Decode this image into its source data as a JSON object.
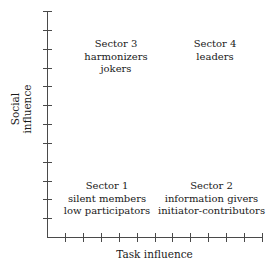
{
  "chart_data": {
    "type": "scatter",
    "title": "",
    "xlabel": "Task influence",
    "ylabel": "Social\ninfluence",
    "grid": false,
    "legend": null,
    "xlim": [
      0,
      12
    ],
    "ylim": [
      0,
      12
    ],
    "x_tick_count": 12,
    "y_tick_count": 12,
    "x_tick_labels": [],
    "y_tick_labels": [],
    "annotations": [
      {
        "id": "sector-1",
        "quadrant": "bottom-left",
        "x": 3,
        "y": 2,
        "lines": [
          "Sector 1",
          "silent members",
          "low participators"
        ]
      },
      {
        "id": "sector-2",
        "quadrant": "bottom-right",
        "x": 9,
        "y": 2,
        "lines": [
          "Sector 2",
          "information givers",
          "initiator-contributors"
        ]
      },
      {
        "id": "sector-3",
        "quadrant": "top-left",
        "x": 3,
        "y": 10,
        "lines": [
          "Sector 3",
          "harmonizers",
          "jokers"
        ]
      },
      {
        "id": "sector-4",
        "quadrant": "top-right",
        "x": 9,
        "y": 10,
        "lines": [
          "Sector 4",
          "leaders"
        ]
      }
    ],
    "colors": {
      "background": "#ffffff",
      "axis": "#4a4a4a",
      "text": "#1a1a1a"
    }
  },
  "axes": {
    "x_title": "Task influence",
    "y_title_line1": "Social",
    "y_title_line2": "influence"
  },
  "sectors": {
    "s3": {
      "line1": "Sector 3",
      "line2": "harmonizers",
      "line3": "jokers"
    },
    "s4": {
      "line1": "Sector 4",
      "line2": "leaders",
      "line3": ""
    },
    "s1": {
      "line1": "Sector 1",
      "line2": "silent members",
      "line3": "low participators"
    },
    "s2": {
      "line1": "Sector 2",
      "line2": "information givers",
      "line3": "initiator-contributors"
    }
  }
}
